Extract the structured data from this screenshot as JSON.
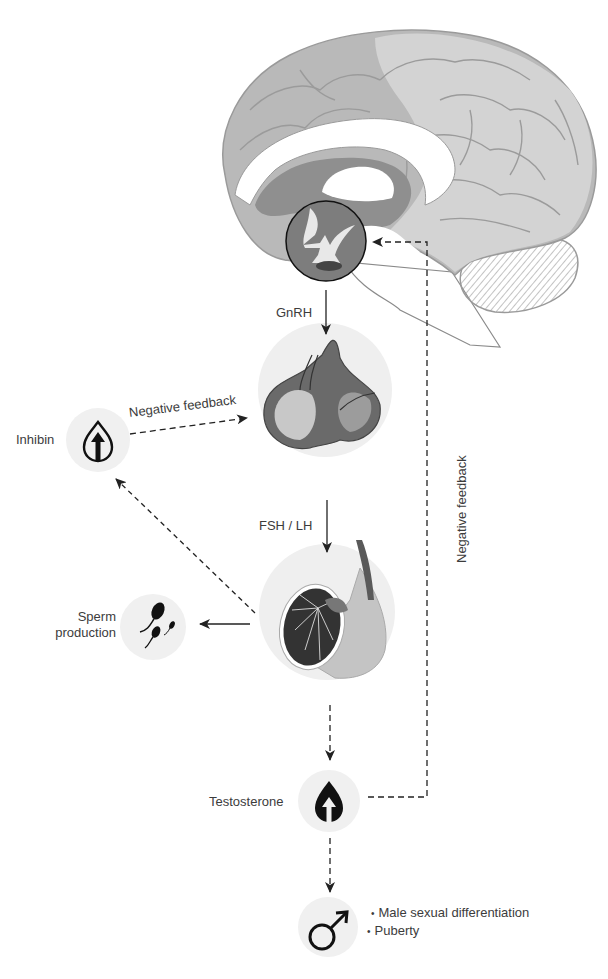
{
  "diagram": {
    "nodes": {
      "brain": {
        "label": "Brain (hypothalamus)"
      },
      "pituitary": {
        "label": "Pituitary"
      },
      "testis": {
        "label": "Testis"
      },
      "inhibin": {
        "label": "Inhibin",
        "icon": "drop-arrow-up-outline-icon"
      },
      "sperm": {
        "label_line1": "Sperm",
        "label_line2": "production",
        "icon": "sperm-icon"
      },
      "testosterone": {
        "label": "Testosterone",
        "icon": "drop-arrow-up-filled-icon"
      },
      "male": {
        "icon": "male-symbol-icon",
        "effects": [
          "Male sexual differentiation",
          "Puberty"
        ]
      }
    },
    "edges": {
      "gnrh": "GnRH",
      "fsh_lh": "FSH / LH",
      "negative_feedback_inhibin": "Negative feedback",
      "negative_feedback_testosterone": "Negative feedback"
    },
    "colors": {
      "brain_outer": "#a9a9a9",
      "brain_inner": "#cfcfcf",
      "brain_dark": "#8e8e8e",
      "circle_bg": "#f0f0f0",
      "arrow": "#222222",
      "text": "#3c3c3c"
    }
  }
}
